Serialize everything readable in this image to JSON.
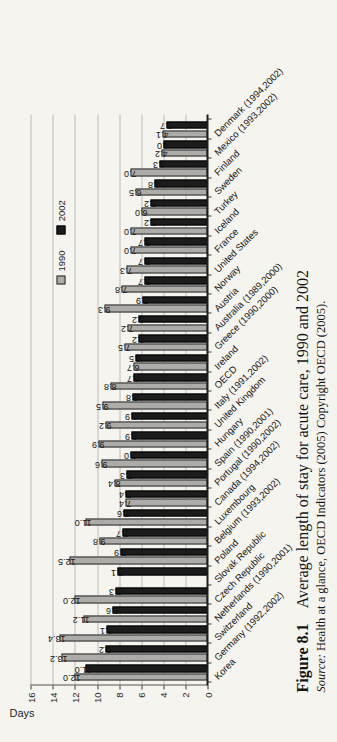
{
  "figure": {
    "caption_label": "Figure 8.1",
    "caption_title": "Average length of stay for acute care, 1990 and 2002",
    "source_prefix": "Source:",
    "source_text": "Health at a glance, OECD Indicators (2005) Copyright OECD (2005)."
  },
  "chart_data": {
    "type": "bar",
    "title": "Average length of stay for acute care, 1990 and 2002",
    "xlabel": "",
    "ylabel": "Days",
    "ylim": [
      0,
      16
    ],
    "ytick_step": 2,
    "grid": true,
    "legend_position": "inside-top-right",
    "page_orientation": "chart rotated 90 degrees counterclockwise on portrait page",
    "value_labels": "one decimal, rotated 90 degrees",
    "categories": [
      "Korea",
      "Germany (1992,2002)",
      "Switzerland",
      "Netherlands (1990,2001)",
      "Czech Republic",
      "Slovak Republic",
      "Poland",
      "Belgium (1993,2002)",
      "Luxembourg",
      "Canada (1994,2002)",
      "Portugal (1990,2002)",
      "Spain (1990,2001)",
      "Hungary",
      "United Kingdom",
      "Italy (1991,2002)",
      "OECD",
      "Ireland",
      "Greece (1990,2000)",
      "Australia (1989,2000)",
      "Austria",
      "Norway",
      "United States",
      "France",
      "Iceland",
      "Turkey",
      "Sweden",
      "Finland",
      "Mexico (1993,2002)",
      "Denmark (1994,2002)"
    ],
    "series": [
      {
        "name": "1990",
        "color": "#adaca9",
        "values": [
          12.0,
          13.2,
          13.4,
          11.2,
          12.0,
          null,
          12.5,
          9.8,
          11.0,
          7.4,
          8.4,
          9.6,
          9.9,
          9.2,
          9.5,
          8.8,
          6.7,
          7.5,
          7.2,
          9.3,
          7.8,
          7.3,
          7.0,
          7.0,
          6.0,
          6.5,
          7.0,
          4.2,
          4.1
        ]
      },
      {
        "name": "2002",
        "color": "#1c1c1c",
        "values": [
          11.0,
          9.2,
          9.1,
          8.6,
          8.3,
          8.1,
          7.9,
          7.7,
          7.6,
          7.4,
          7.3,
          7.0,
          6.9,
          6.9,
          6.8,
          6.7,
          6.5,
          6.2,
          6.2,
          5.9,
          5.7,
          5.7,
          5.7,
          5.2,
          5.2,
          4.8,
          4.3,
          4.0,
          3.7
        ]
      }
    ]
  },
  "colors": {
    "background": "#f5f4ef",
    "gridline": "#bcbab5",
    "axis": "#1f1f1f",
    "text": "#1a1a1a"
  }
}
